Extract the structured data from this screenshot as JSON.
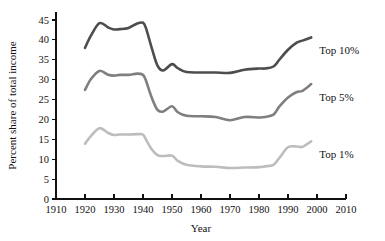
{
  "chart_data": {
    "type": "line",
    "title": "",
    "xlabel": "Year",
    "ylabel": "Percent share of total income",
    "xlim": [
      1910,
      2010
    ],
    "ylim": [
      0,
      47
    ],
    "grid": false,
    "legend_position": "inline-right",
    "xticks": [
      1910,
      1920,
      1930,
      1940,
      1950,
      1960,
      1970,
      1980,
      1990,
      2000,
      2010
    ],
    "yticks": [
      0,
      5,
      10,
      15,
      20,
      25,
      30,
      35,
      40,
      45
    ],
    "x": [
      1920,
      1922,
      1925,
      1928,
      1930,
      1932,
      1935,
      1938,
      1940,
      1941,
      1943,
      1945,
      1947,
      1950,
      1952,
      1955,
      1960,
      1965,
      1970,
      1975,
      1980,
      1982,
      1985,
      1987,
      1990,
      1993,
      1995,
      1998
    ],
    "series": [
      {
        "name": "Top 10%",
        "color": "#4d4d4d",
        "label": "Top 10%",
        "values": [
          38.0,
          41.0,
          44.2,
          43.1,
          42.6,
          42.7,
          43.0,
          44.1,
          44.3,
          43.0,
          38.0,
          33.5,
          32.3,
          33.9,
          32.9,
          31.9,
          31.8,
          31.8,
          31.7,
          32.5,
          32.8,
          32.8,
          33.3,
          35.0,
          37.5,
          39.3,
          39.8,
          40.6
        ]
      },
      {
        "name": "Top 5%",
        "color": "#7f7f7f",
        "label": "Top 5%",
        "values": [
          27.4,
          30.1,
          32.2,
          31.2,
          31.0,
          31.2,
          31.2,
          31.5,
          31.2,
          29.8,
          25.5,
          22.4,
          22.0,
          23.3,
          21.8,
          20.9,
          20.8,
          20.6,
          19.8,
          20.6,
          20.5,
          20.6,
          21.2,
          23.2,
          25.5,
          26.9,
          27.2,
          28.9
        ]
      },
      {
        "name": "Top 1%",
        "color": "#bdbdbd",
        "label": "Top 1%",
        "values": [
          13.9,
          15.8,
          17.8,
          16.6,
          16.1,
          16.2,
          16.2,
          16.3,
          16.2,
          15.0,
          12.5,
          11.0,
          10.8,
          10.9,
          9.6,
          8.6,
          8.2,
          8.1,
          7.8,
          7.9,
          8.0,
          8.2,
          8.6,
          10.3,
          13.0,
          13.2,
          13.1,
          14.5
        ]
      }
    ]
  },
  "axes": {
    "y_label": "Percent share of total income",
    "x_label": "Year",
    "y_tick_labels": [
      "0",
      "5",
      "10",
      "15",
      "20",
      "25",
      "30",
      "35",
      "40",
      "45"
    ],
    "x_tick_labels": [
      "1910",
      "1920",
      "1930",
      "1940",
      "1950",
      "1960",
      "1970",
      "1980",
      "1990",
      "2000",
      "2010"
    ]
  },
  "series_labels": {
    "top10": "Top 10%",
    "top5": "Top 5%",
    "top1": "Top 1%"
  },
  "colors": {
    "top10": "#4d4d4d",
    "top5": "#7f7f7f",
    "top1": "#bdbdbd",
    "axis": "#111111",
    "background": "#ffffff"
  }
}
